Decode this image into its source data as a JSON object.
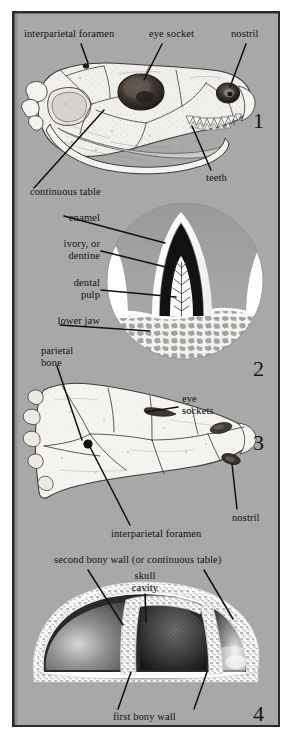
{
  "figure": {
    "background_color": "#a8a8a8",
    "frame_color": "#2b2b2b",
    "text_color": "#131313"
  },
  "panels": [
    {
      "number": "1",
      "subject": "skull-lateral-view",
      "labels": [
        {
          "id": "interparietal-foramen",
          "text": "interparietal foramen"
        },
        {
          "id": "eye-socket",
          "text": "eye socket"
        },
        {
          "id": "nostril",
          "text": "nostril"
        },
        {
          "id": "continuous-table",
          "text": "continuous table"
        },
        {
          "id": "teeth",
          "text": "teeth"
        }
      ]
    },
    {
      "number": "2",
      "subject": "tooth-cross-section",
      "labels": [
        {
          "id": "enamel",
          "text": "enamel"
        },
        {
          "id": "ivory-or-dentine",
          "text": "ivory, or\ndentine",
          "line1": "ivory, or",
          "line2": "dentine"
        },
        {
          "id": "dental-pulp",
          "text": "dental\npulp",
          "line1": "dental",
          "line2": "pulp"
        },
        {
          "id": "lower-jaw",
          "text": "lower jaw"
        }
      ]
    },
    {
      "number": "3",
      "subject": "skull-dorsal-view",
      "labels": [
        {
          "id": "parietal-bone",
          "text": "parietal\nbone",
          "line1": "parietal",
          "line2": "bone"
        },
        {
          "id": "eye-sockets",
          "text": "eye\nsockets",
          "line1": "eye",
          "line2": "sockets"
        },
        {
          "id": "interparietal-foramen",
          "text": "interparietal foramen"
        },
        {
          "id": "nostril",
          "text": "nostril"
        }
      ]
    },
    {
      "number": "4",
      "subject": "skull-roof-cross-section",
      "labels": [
        {
          "id": "second-bony-wall",
          "text": "second bony wall (or continuous table)"
        },
        {
          "id": "skull-cavity",
          "text": "skull\ncavity",
          "line1": "skull",
          "line2": "cavity"
        },
        {
          "id": "first-bony-wall",
          "text": "first bony wall"
        }
      ]
    }
  ]
}
